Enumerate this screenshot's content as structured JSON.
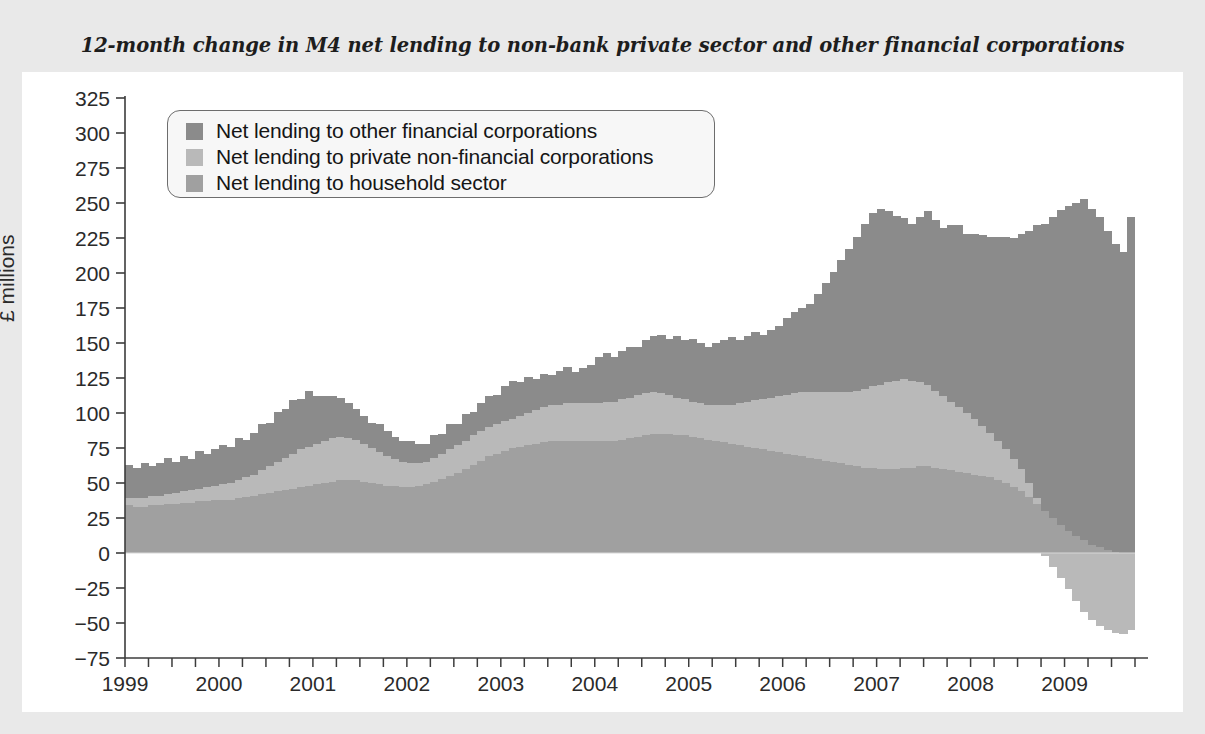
{
  "title": "12-month change in M4 net lending to non-bank private sector and other financial corporations",
  "legend": {
    "items": [
      {
        "label": "Net lending to other financial corporations",
        "color": "#8b8b8b",
        "key": "ofc"
      },
      {
        "label": "Net lending to private non-financial corporations",
        "color": "#b9b9b9",
        "key": "pnfc"
      },
      {
        "label": "Net lending to household sector",
        "color": "#a0a0a0",
        "key": "household"
      }
    ]
  },
  "chart_data": {
    "type": "bar",
    "stacked": true,
    "title": "12-month change in M4 net lending to non-bank private sector and other financial corporations",
    "xlabel": "",
    "ylabel": "£ millions",
    "ylim": [
      -75,
      325
    ],
    "ytick_step": 25,
    "yticks": [
      325,
      300,
      275,
      250,
      225,
      200,
      175,
      150,
      125,
      100,
      75,
      50,
      25,
      0,
      -25,
      -50,
      -75
    ],
    "xticks_major": [
      "1999",
      "2000",
      "2001",
      "2002",
      "2003",
      "2004",
      "2005",
      "2006",
      "2007",
      "2008",
      "2009"
    ],
    "x_minor_tick_interval": "quarterly",
    "x_start": "1999-01",
    "x_end": "2009-09",
    "grid": false,
    "legend_position": "upper-left-inside",
    "series": [
      {
        "name": "Net lending to household sector",
        "color": "#a0a0a0",
        "values": [
          34,
          33,
          33,
          34,
          34,
          35,
          35,
          36,
          36,
          37,
          37,
          38,
          38,
          38,
          39,
          40,
          41,
          42,
          43,
          44,
          45,
          46,
          47,
          48,
          49,
          50,
          51,
          52,
          52,
          52,
          51,
          50,
          49,
          48,
          48,
          47,
          47,
          48,
          49,
          51,
          53,
          55,
          57,
          60,
          63,
          66,
          69,
          71,
          73,
          75,
          76,
          77,
          78,
          79,
          80,
          80,
          80,
          80,
          80,
          80,
          80,
          80,
          80,
          81,
          82,
          83,
          84,
          85,
          85,
          85,
          84,
          84,
          83,
          82,
          81,
          80,
          79,
          78,
          77,
          76,
          75,
          74,
          73,
          72,
          71,
          70,
          69,
          68,
          67,
          66,
          65,
          64,
          63,
          62,
          61,
          61,
          60,
          60,
          60,
          61,
          61,
          62,
          62,
          61,
          60,
          59,
          58,
          57,
          56,
          55,
          54,
          52,
          50,
          47,
          44,
          40,
          35,
          30,
          25,
          20,
          16,
          12,
          9,
          6,
          4,
          2,
          1,
          0,
          0
        ]
      },
      {
        "name": "Net lending to private non-financial corporations",
        "color": "#b9b9b9",
        "values": [
          5,
          6,
          6,
          7,
          7,
          7,
          8,
          8,
          9,
          9,
          10,
          10,
          11,
          12,
          13,
          14,
          15,
          17,
          19,
          21,
          23,
          25,
          27,
          28,
          29,
          30,
          31,
          31,
          30,
          29,
          27,
          25,
          23,
          21,
          19,
          18,
          17,
          16,
          16,
          17,
          18,
          19,
          20,
          20,
          21,
          21,
          21,
          21,
          21,
          21,
          22,
          23,
          24,
          25,
          26,
          26,
          27,
          27,
          27,
          27,
          27,
          28,
          28,
          29,
          29,
          30,
          30,
          30,
          29,
          28,
          27,
          26,
          25,
          25,
          25,
          26,
          27,
          28,
          30,
          32,
          34,
          36,
          38,
          40,
          42,
          44,
          46,
          47,
          48,
          49,
          50,
          51,
          52,
          54,
          56,
          58,
          60,
          62,
          63,
          63,
          62,
          60,
          58,
          55,
          52,
          49,
          46,
          43,
          40,
          36,
          32,
          28,
          24,
          20,
          16,
          10,
          4,
          -2,
          -10,
          -18,
          -26,
          -34,
          -42,
          -48,
          -52,
          -55,
          -57,
          -58,
          -55
        ]
      },
      {
        "name": "Net lending to other financial corporations",
        "color": "#8b8b8b",
        "values": [
          24,
          22,
          25,
          21,
          23,
          26,
          22,
          25,
          22,
          27,
          24,
          26,
          28,
          26,
          30,
          27,
          30,
          33,
          31,
          36,
          35,
          38,
          36,
          40,
          34,
          32,
          30,
          28,
          25,
          22,
          20,
          18,
          20,
          18,
          16,
          15,
          16,
          14,
          13,
          16,
          14,
          18,
          15,
          19,
          17,
          20,
          22,
          21,
          25,
          27,
          24,
          26,
          22,
          24,
          21,
          24,
          26,
          22,
          25,
          27,
          33,
          35,
          32,
          34,
          36,
          34,
          38,
          40,
          42,
          40,
          44,
          42,
          45,
          43,
          41,
          44,
          46,
          48,
          45,
          47,
          49,
          46,
          48,
          50,
          55,
          58,
          60,
          63,
          70,
          78,
          86,
          94,
          102,
          110,
          118,
          124,
          126,
          122,
          118,
          115,
          112,
          118,
          124,
          122,
          120,
          126,
          130,
          128,
          132,
          136,
          140,
          146,
          152,
          158,
          168,
          180,
          195,
          205,
          215,
          225,
          232,
          238,
          244,
          240,
          236,
          228,
          220,
          215,
          240
        ]
      }
    ]
  }
}
